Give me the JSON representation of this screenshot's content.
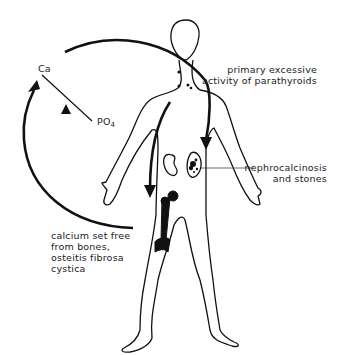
{
  "diagram": {
    "type": "medical-illustration",
    "colors": {
      "stroke": "#111111",
      "background": "#ffffff",
      "text": "#222222"
    }
  },
  "labels": {
    "ca": "Ca",
    "po4_base": "PO",
    "po4_sub": "4",
    "parathyroid_line1": "primary excessive",
    "parathyroid_line2": "activity of parathyroids",
    "kidney_line1": "nephrocalcinosis",
    "kidney_line2": "and stones",
    "bone_line1": "calcium set free",
    "bone_line2": "from bones,",
    "bone_line3": "osteitis fibrosa",
    "bone_line4": "cystica"
  }
}
